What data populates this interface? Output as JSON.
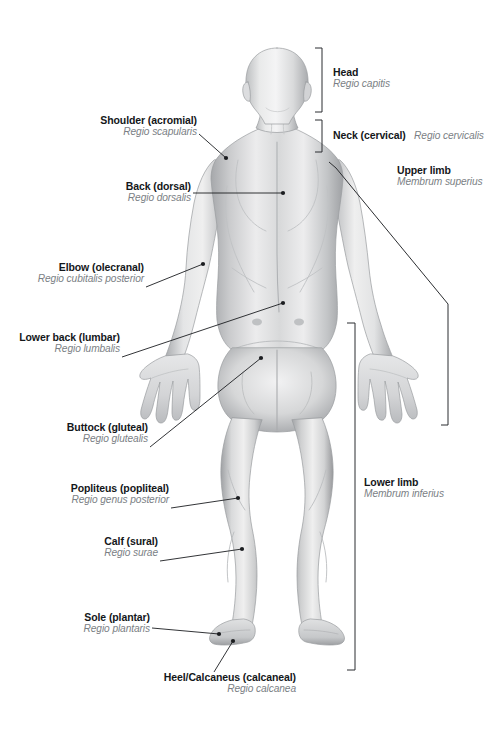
{
  "figure": {
    "view": "posterior",
    "palette": {
      "body_light": "#f2f2f3",
      "body_mid": "#cfd0d2",
      "body_shadow": "#a8aaad",
      "body_dark": "#8d9093",
      "outline": "#9a9c9f",
      "label_en": "#14171a",
      "label_la": "#7b7f85",
      "leader": "#1b1d20",
      "bracket": "#2b2d30",
      "background": "#ffffff"
    }
  },
  "labels": {
    "head": {
      "en": "Head",
      "la": "Regio capitis"
    },
    "neck": {
      "en": "Neck (cervical)",
      "la": "Regio cervicalis"
    },
    "upper_limb": {
      "en": "Upper limb",
      "la": "Membrum superius"
    },
    "lower_limb": {
      "en": "Lower limb",
      "la": "Membrum inferius"
    },
    "shoulder": {
      "en": "Shoulder (acromial)",
      "la": "Regio scapularis"
    },
    "back": {
      "en": "Back (dorsal)",
      "la": "Regio dorsalis"
    },
    "elbow": {
      "en": "Elbow (olecranal)",
      "la": "Regio cubitalis posterior"
    },
    "lower_back": {
      "en": "Lower back (lumbar)",
      "la": "Regio lumbalis"
    },
    "buttock": {
      "en": "Buttock (gluteal)",
      "la": "Regio glutealis"
    },
    "popliteus": {
      "en": "Popliteus (popliteal)",
      "la": "Regio genus posterior"
    },
    "calf": {
      "en": "Calf (sural)",
      "la": "Regio surae"
    },
    "sole": {
      "en": "Sole (plantar)",
      "la": "Regio plantaris"
    },
    "heel": {
      "en": "Heel/Calcaneus (calcaneal)",
      "la": "Regio calcanea"
    }
  },
  "annotations": {
    "leaders": [
      {
        "name": "shoulder",
        "from": [
          199,
          134
        ],
        "to": [
          226,
          158
        ]
      },
      {
        "name": "back",
        "from": [
          193,
          193
        ],
        "to": [
          283,
          193
        ]
      },
      {
        "name": "elbow",
        "from": [
          146,
          287
        ],
        "to": [
          203,
          264
        ]
      },
      {
        "name": "lower_back",
        "from": [
          122,
          357
        ],
        "to": [
          283,
          303
        ]
      },
      {
        "name": "buttock",
        "from": [
          150,
          447
        ],
        "to": [
          261,
          358
        ]
      },
      {
        "name": "popliteus",
        "from": [
          171,
          508
        ],
        "to": [
          238,
          498
        ]
      },
      {
        "name": "calf",
        "from": [
          160,
          561
        ],
        "to": [
          242,
          549
        ]
      },
      {
        "name": "sole",
        "from": [
          152,
          628
        ],
        "to": [
          219,
          634
        ]
      },
      {
        "name": "heel",
        "from": [
          214,
          672
        ],
        "to": [
          233,
          641
        ]
      }
    ],
    "brackets": [
      {
        "name": "head",
        "x": 322,
        "y1": 48,
        "y2": 112,
        "tick": 7
      },
      {
        "name": "neck",
        "x": 322,
        "y1": 120,
        "y2": 152,
        "tick": 7
      },
      {
        "name": "lower_limb",
        "x": 355,
        "y1": 323,
        "y2": 670,
        "tick": 8
      },
      {
        "name": "upper_limb",
        "points": "329,162 448,304 448,425",
        "tick_top": [
          329,
          162
        ],
        "tick_bottom": [
          448,
          425
        ]
      }
    ]
  }
}
